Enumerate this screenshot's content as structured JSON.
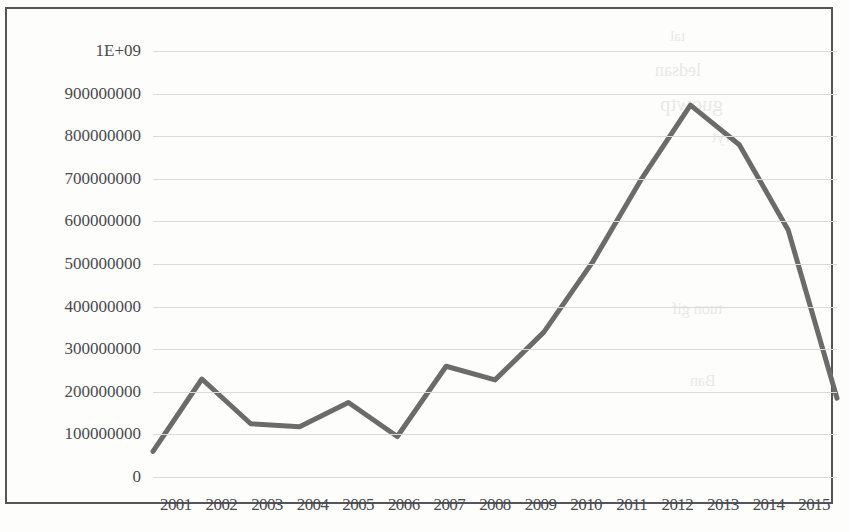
{
  "page": {
    "background_color": "#fdfdfc",
    "frame_color": "#55545a",
    "bleed_through_notes": [
      "tal",
      "ledsan",
      "guowtp",
      "ryt",
      "tuon gif",
      "Ban"
    ]
  },
  "chart_data": {
    "type": "line",
    "title": "",
    "subtitle": "",
    "xlabel": "",
    "ylabel": "",
    "grid": true,
    "legend_position": "none",
    "line_color": "#6b6b6b",
    "line_width": 5,
    "categories": [
      "2001",
      "2002",
      "2003",
      "2004",
      "2005",
      "2006",
      "2007",
      "2008",
      "2009",
      "2010",
      "2011",
      "2012",
      "2013",
      "2014",
      "2015"
    ],
    "x": [
      2001,
      2002,
      2003,
      2004,
      2005,
      2006,
      2007,
      2008,
      2009,
      2010,
      2011,
      2012,
      2013,
      2014,
      2015
    ],
    "values": [
      60000000,
      230000000,
      125000000,
      118000000,
      175000000,
      95000000,
      260000000,
      228000000,
      340000000,
      505000000,
      700000000,
      873000000,
      780000000,
      580000000,
      185000000
    ],
    "ylim": [
      0,
      1000000000
    ],
    "xlim": [
      2001,
      2015
    ],
    "ytick_values": [
      1000000000,
      900000000,
      800000000,
      700000000,
      600000000,
      500000000,
      400000000,
      300000000,
      200000000,
      100000000,
      0
    ],
    "ytick_labels": [
      "1E+09",
      "900000000",
      "800000000",
      "700000000",
      "600000000",
      "500000000",
      "400000000",
      "300000000",
      "200000000",
      "100000000",
      "0"
    ],
    "xtick_labels": [
      "2001",
      "2002",
      "2003",
      "2004",
      "2005",
      "2006",
      "2007",
      "2008",
      "2009",
      "2010",
      "2011",
      "2012",
      "2013",
      "2014",
      "2015"
    ]
  }
}
